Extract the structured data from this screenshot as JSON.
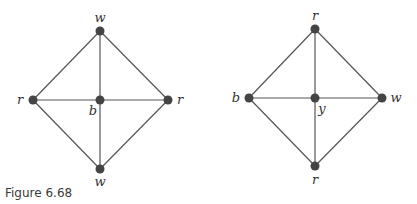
{
  "caption": "Figure 6.68",
  "graphs": [
    {
      "name": "left-graph",
      "nodes": [
        {
          "id": "top",
          "label": "w",
          "x": 100,
          "y": 31,
          "lx": 100,
          "ly": 22
        },
        {
          "id": "left",
          "label": "r",
          "x": 33,
          "y": 100,
          "lx": 20,
          "ly": 104
        },
        {
          "id": "center",
          "label": "b",
          "x": 100,
          "y": 100,
          "lx": 93,
          "ly": 115
        },
        {
          "id": "right",
          "label": "r",
          "x": 168,
          "y": 100,
          "lx": 180,
          "ly": 104
        },
        {
          "id": "bottom",
          "label": "w",
          "x": 100,
          "y": 169,
          "lx": 100,
          "ly": 186
        }
      ],
      "edges": [
        [
          "top",
          "left"
        ],
        [
          "top",
          "right"
        ],
        [
          "bottom",
          "left"
        ],
        [
          "bottom",
          "right"
        ],
        [
          "top",
          "bottom"
        ],
        [
          "left",
          "right"
        ]
      ]
    },
    {
      "name": "right-graph",
      "nodes": [
        {
          "id": "top",
          "label": "r",
          "x": 315,
          "y": 29,
          "lx": 315,
          "ly": 20
        },
        {
          "id": "left",
          "label": "b",
          "x": 249,
          "y": 98,
          "lx": 236,
          "ly": 102
        },
        {
          "id": "center",
          "label": "y",
          "x": 315,
          "y": 98,
          "lx": 322,
          "ly": 113
        },
        {
          "id": "right",
          "label": "w",
          "x": 382,
          "y": 98,
          "lx": 396,
          "ly": 102
        },
        {
          "id": "bottom",
          "label": "r",
          "x": 315,
          "y": 166,
          "lx": 315,
          "ly": 184
        }
      ],
      "edges": [
        [
          "top",
          "left"
        ],
        [
          "top",
          "right"
        ],
        [
          "bottom",
          "left"
        ],
        [
          "bottom",
          "right"
        ],
        [
          "top",
          "bottom"
        ],
        [
          "left",
          "right"
        ]
      ]
    }
  ]
}
